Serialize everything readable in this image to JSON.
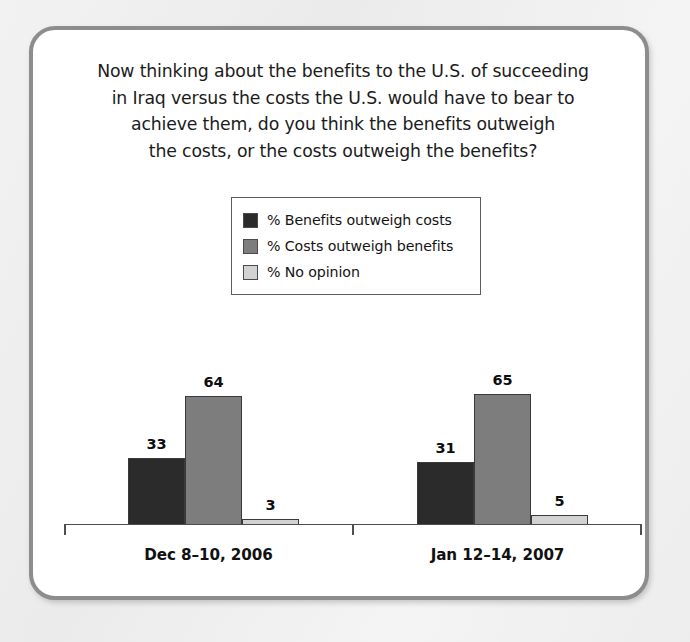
{
  "card": {
    "question_lines": [
      "Now thinking about the benefits to the U.S. of succeeding",
      "in Iraq versus the costs the U.S. would have to bear to",
      "achieve them, do you think the benefits outweigh",
      "the costs, or the costs outweigh the benefits?"
    ]
  },
  "legend": {
    "items": [
      {
        "label": "% Benefits outweigh costs",
        "color": "#2b2b2b"
      },
      {
        "label": "% Costs outweigh benefits",
        "color": "#7d7d7d"
      },
      {
        "label": "% No opinion",
        "color": "#d2d2d2"
      }
    ]
  },
  "chart_data": {
    "type": "bar",
    "xlabel": "",
    "ylabel": "",
    "ylim": [
      0,
      100
    ],
    "grid": false,
    "legend_position": "top-center",
    "categories": [
      "Dec 8–10, 2006",
      "Jan 12–14, 2007"
    ],
    "series": [
      {
        "name": "% Benefits outweigh costs",
        "color": "#2b2b2b",
        "values": [
          33,
          31
        ]
      },
      {
        "name": "% Costs outweigh benefits",
        "color": "#7d7d7d",
        "values": [
          64,
          65
        ]
      },
      {
        "name": "% No opinion",
        "color": "#d2d2d2",
        "values": [
          3,
          5
        ]
      }
    ]
  }
}
